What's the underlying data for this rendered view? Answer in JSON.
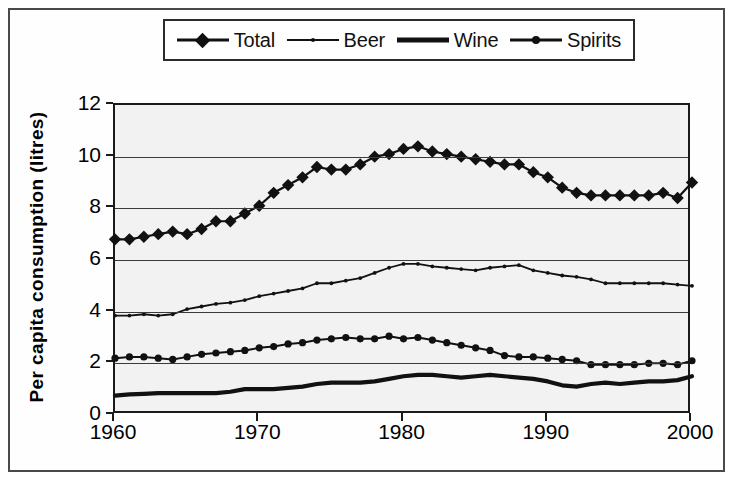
{
  "legend": {
    "position": "top",
    "entries": [
      {
        "label": "Total",
        "marker": "diamond-marker-icon"
      },
      {
        "label": "Beer",
        "marker": "small-dot-marker-icon"
      },
      {
        "label": "Wine",
        "marker": "thick-line-marker-icon"
      },
      {
        "label": "Spirits",
        "marker": "round-dot-marker-icon"
      }
    ]
  },
  "axes": {
    "y_title": "Per capita consumption (litres)",
    "y_ticks": [
      "0",
      "2",
      "4",
      "6",
      "8",
      "10",
      "12"
    ],
    "x_ticks": [
      "1960",
      "1970",
      "1980",
      "1990",
      "2000"
    ]
  },
  "colors": {
    "ink": "#111111",
    "frame": "#1a1a1a",
    "plot_background": "#f2f2f2",
    "gridline": "#3a3a3a"
  },
  "chart_data": {
    "type": "line",
    "title": "",
    "xlabel": "",
    "ylabel": "Per capita consumption (litres)",
    "xlim": [
      1960,
      2000
    ],
    "ylim": [
      0,
      12
    ],
    "ytick_values": [
      0,
      2,
      4,
      6,
      8,
      10,
      12
    ],
    "xtick_values": [
      1960,
      1970,
      1980,
      1990,
      2000
    ],
    "grid": "horizontal",
    "legend_position": "top",
    "x": [
      1960,
      1961,
      1962,
      1963,
      1964,
      1965,
      1966,
      1967,
      1968,
      1969,
      1970,
      1971,
      1972,
      1973,
      1974,
      1975,
      1976,
      1977,
      1978,
      1979,
      1980,
      1981,
      1982,
      1983,
      1984,
      1985,
      1986,
      1987,
      1988,
      1989,
      1990,
      1991,
      1992,
      1993,
      1994,
      1995,
      1996,
      1997,
      1998,
      1999,
      2000
    ],
    "series": [
      {
        "name": "Total",
        "marker": "diamond",
        "values": [
          6.8,
          6.8,
          6.9,
          7.0,
          7.1,
          7.0,
          7.2,
          7.5,
          7.5,
          7.8,
          8.1,
          8.6,
          8.9,
          9.2,
          9.6,
          9.5,
          9.5,
          9.7,
          10.0,
          10.1,
          10.3,
          10.4,
          10.2,
          10.1,
          10.0,
          9.9,
          9.8,
          9.7,
          9.7,
          9.4,
          9.2,
          8.8,
          8.6,
          8.5,
          8.5,
          8.5,
          8.5,
          8.5,
          8.6,
          8.4,
          9.0
        ]
      },
      {
        "name": "Beer",
        "marker": "small-dot",
        "values": [
          3.85,
          3.85,
          3.9,
          3.85,
          3.9,
          4.1,
          4.2,
          4.3,
          4.35,
          4.45,
          4.6,
          4.7,
          4.8,
          4.9,
          5.1,
          5.1,
          5.2,
          5.3,
          5.5,
          5.7,
          5.85,
          5.85,
          5.75,
          5.7,
          5.65,
          5.6,
          5.7,
          5.75,
          5.8,
          5.6,
          5.5,
          5.4,
          5.35,
          5.25,
          5.1,
          5.1,
          5.1,
          5.1,
          5.1,
          5.05,
          5.0
        ]
      },
      {
        "name": "Wine",
        "marker": "none",
        "values": [
          0.75,
          0.8,
          0.82,
          0.85,
          0.85,
          0.85,
          0.85,
          0.85,
          0.9,
          1.0,
          1.0,
          1.0,
          1.05,
          1.1,
          1.2,
          1.25,
          1.25,
          1.25,
          1.3,
          1.4,
          1.5,
          1.55,
          1.55,
          1.5,
          1.45,
          1.5,
          1.55,
          1.5,
          1.45,
          1.4,
          1.3,
          1.15,
          1.1,
          1.2,
          1.25,
          1.2,
          1.25,
          1.3,
          1.3,
          1.35,
          1.5
        ]
      },
      {
        "name": "Spirits",
        "marker": "round-dot",
        "values": [
          2.2,
          2.25,
          2.25,
          2.2,
          2.15,
          2.25,
          2.35,
          2.4,
          2.45,
          2.5,
          2.6,
          2.65,
          2.75,
          2.8,
          2.9,
          2.95,
          3.0,
          2.95,
          2.95,
          3.05,
          2.95,
          3.0,
          2.9,
          2.8,
          2.7,
          2.6,
          2.5,
          2.3,
          2.25,
          2.25,
          2.2,
          2.15,
          2.1,
          1.95,
          1.95,
          1.95,
          1.95,
          2.0,
          2.0,
          1.95,
          2.1
        ]
      }
    ]
  }
}
